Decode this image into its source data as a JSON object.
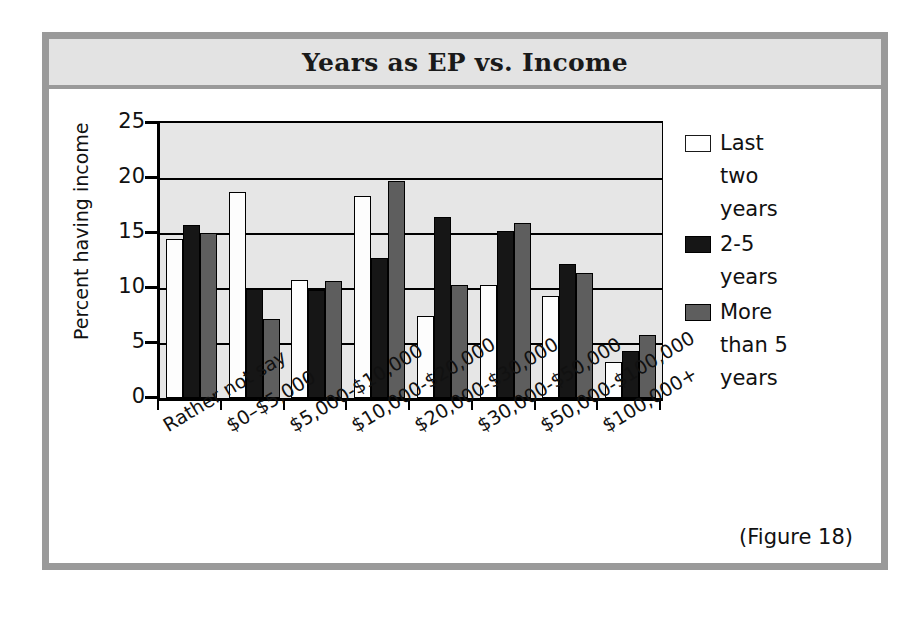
{
  "figure": {
    "title": "Years as EP vs. Income",
    "caption": "(Figure 18)"
  },
  "chart_data": {
    "type": "bar",
    "title": "Years as EP vs. Income",
    "xlabel": "",
    "ylabel": "Percent having income",
    "ylim": [
      0,
      25
    ],
    "yticks": [
      0,
      5,
      10,
      15,
      20,
      25
    ],
    "grid": true,
    "legend_position": "right",
    "categories": [
      "Rather not say",
      "$0–$5,000",
      "$5,000-$10,000",
      "$10,000-$20,000",
      "$20,000-$30,000",
      "$30,000-$50,000",
      "$50,000-$100,000",
      "$100,000+"
    ],
    "series": [
      {
        "name": "Last two years",
        "color": "#ffffff",
        "values": [
          14.5,
          18.7,
          10.7,
          18.4,
          7.5,
          10.3,
          9.3,
          3.3
        ]
      },
      {
        "name": "2-5 years",
        "color": "#161616",
        "values": [
          15.7,
          9.9,
          9.8,
          12.7,
          16.5,
          15.2,
          12.2,
          4.3
        ]
      },
      {
        "name": "More than 5 years",
        "color": "#5e5e5e",
        "values": [
          15.0,
          7.2,
          10.6,
          19.7,
          10.3,
          15.9,
          11.4,
          5.7
        ]
      }
    ]
  },
  "legend": {
    "entries": [
      {
        "swatch": "white-square-swatch",
        "lines": [
          "Last",
          "two",
          "years"
        ]
      },
      {
        "swatch": "black-square-swatch",
        "lines": [
          "2-5",
          "years"
        ]
      },
      {
        "swatch": "gray-square-swatch",
        "lines": [
          "More",
          "than 5",
          "years"
        ]
      }
    ]
  }
}
